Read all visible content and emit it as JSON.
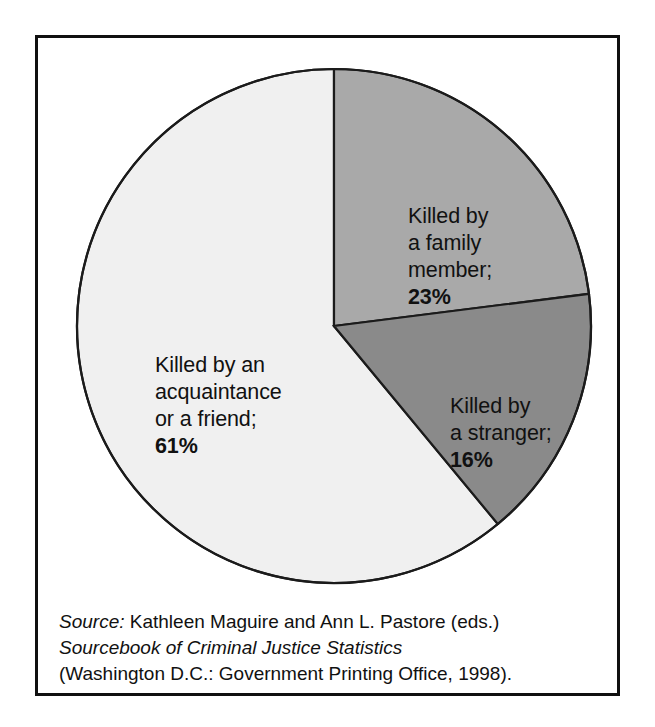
{
  "figure": {
    "background_color": "#ffffff",
    "frame_color": "#101010"
  },
  "chart_data": {
    "type": "pie",
    "title": "",
    "subtitle": "",
    "xlabel": "",
    "ylabel": "",
    "legend_position": "inside-slices",
    "grid": false,
    "start_angle_deg": 0,
    "direction": "clockwise",
    "categories": [
      "Killed by a family member",
      "Killed by a stranger",
      "Killed by an acquaintance or a friend"
    ],
    "values": [
      23,
      16,
      61
    ],
    "value_unit": "%",
    "slice_colors": [
      "#a9a9a9",
      "#8a8a8a",
      "#f0f0f0"
    ],
    "slices": [
      {
        "name": "family-member",
        "label_text": "Killed by\na family\nmember;",
        "percent_text": "23%",
        "value": 23,
        "color": "#a9a9a9",
        "angle_deg": 82.8
      },
      {
        "name": "stranger",
        "label_text": "Killed by\na stranger;",
        "percent_text": "16%",
        "value": 16,
        "color": "#8a8a8a",
        "angle_deg": 57.6
      },
      {
        "name": "acquaintance-or-friend",
        "label_text": "Killed by an\nacquaintance\nor a friend;",
        "percent_text": "61%",
        "value": 61,
        "color": "#f0f0f0",
        "angle_deg": 219.6
      }
    ]
  },
  "source_note": {
    "label": "Source:",
    "line1_rest": " Kathleen Maguire and Ann L. Pastore (eds.)",
    "line2": "Sourcebook of Criminal Justice Statistics",
    "line3": "(Washington D.C.: Government Printing Office, 1998)."
  }
}
